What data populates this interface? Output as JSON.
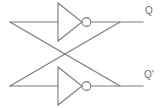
{
  "diagram": {
    "type": "logic-circuit-schematic",
    "background_color": "#ffffff",
    "line_color": "#7b7b7b",
    "text_color": "#6e6e6e",
    "canvas": {
      "width": 165,
      "height": 108
    },
    "gates": [
      {
        "id": "inverter-top",
        "name": "NOT gate (inverter)",
        "symbol": "triangle-with-bubble",
        "input_y": 22,
        "output_y": 22,
        "triangle": {
          "x1": 58,
          "y1": 3,
          "x2": 58,
          "y2": 41,
          "apex_x": 82,
          "apex_y": 22
        },
        "bubble": {
          "cx": 86.5,
          "cy": 22,
          "r": 4.5
        }
      },
      {
        "id": "inverter-bottom",
        "name": "NOT gate (inverter)",
        "symbol": "triangle-with-bubble",
        "input_y": 86,
        "output_y": 86,
        "triangle": {
          "x1": 58,
          "y1": 67,
          "x2": 58,
          "y2": 105,
          "apex_x": 82,
          "apex_y": 86
        },
        "bubble": {
          "cx": 86.5,
          "cy": 86,
          "r": 4.5
        }
      }
    ],
    "wires": [
      {
        "id": "top-input-rail",
        "name": "top inverter input rail",
        "points": "10,22 58,22"
      },
      {
        "id": "top-output-rail",
        "name": "top inverter output to Q",
        "points": "91,22 143,22"
      },
      {
        "id": "bottom-input-rail",
        "name": "bottom inverter input rail",
        "points": "10,86 58,86"
      },
      {
        "id": "bottom-output-rail",
        "name": "bottom inverter output to Q-prime",
        "points": "91,86 143,86"
      },
      {
        "id": "feedback-top-to-bottom",
        "name": "cross-coupled feedback from top output to bottom input",
        "points": "120,22 10,86"
      },
      {
        "id": "feedback-bottom-to-top",
        "name": "cross-coupled feedback from bottom output to top input",
        "points": "10,22 120,86"
      }
    ],
    "junctions": [
      {
        "id": "junction-top-right",
        "x": 120,
        "y": 22
      },
      {
        "id": "junction-bottom-right",
        "x": 120,
        "y": 86
      },
      {
        "id": "junction-top-left",
        "x": 10,
        "y": 22
      },
      {
        "id": "junction-bottom-left",
        "x": 10,
        "y": 86
      }
    ],
    "labels": {
      "q": "Q",
      "q_bar": "Q'"
    }
  }
}
